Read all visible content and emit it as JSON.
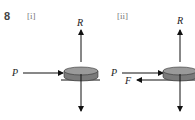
{
  "question": {
    "number": "8",
    "parts": [
      {
        "label": "[i]",
        "forces": [
          {
            "name": "R",
            "direction": "up"
          },
          {
            "name": "P",
            "direction": "right"
          },
          {
            "name": "",
            "direction": "down"
          }
        ]
      },
      {
        "label": "[ii]",
        "forces": [
          {
            "name": "R",
            "direction": "up"
          },
          {
            "name": "P",
            "direction": "right"
          },
          {
            "name": "F",
            "direction": "left"
          },
          {
            "name": "",
            "direction": "down"
          }
        ]
      }
    ]
  },
  "colors": {
    "puck_top": "#9a9a9a",
    "puck_side": "#7a7a7a",
    "arrow": "#111111"
  }
}
